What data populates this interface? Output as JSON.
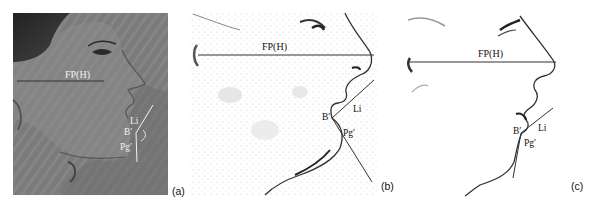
{
  "figure": {
    "panels": [
      {
        "id": "a",
        "panel_label": "(a)",
        "style": "photograph",
        "labels": {
          "line": "FP(H)",
          "li": "Li",
          "b": "B′",
          "pg": "Pg′"
        }
      },
      {
        "id": "b",
        "panel_label": "(b)",
        "style": "line-drawing",
        "labels": {
          "line": "FP(H)",
          "li": "Li",
          "b": "B′",
          "pg": "Pg′"
        }
      },
      {
        "id": "c",
        "panel_label": "(c)",
        "style": "line-drawing",
        "labels": {
          "line": "FP(H)",
          "li": "Li",
          "b": "B′",
          "pg": "Pg′"
        }
      }
    ],
    "colors": {
      "photo_bg": "#7a7a7a",
      "line_dark": "#333333",
      "line_white": "#f2f2f2"
    }
  }
}
